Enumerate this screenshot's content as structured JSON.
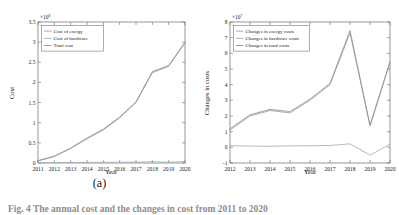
{
  "figure": {
    "caption": "Fig. 4  The annual cost and the changes in cost from 2011 to 2020",
    "subcaptions": [
      "(a)",
      "(b)"
    ],
    "background_color": "#ffffff",
    "axis_color": "#6a6a6a"
  },
  "chart_data": [
    {
      "type": "line",
      "panel": "a",
      "title": "",
      "xlabel": "Year",
      "ylabel": "Cost",
      "y_exponent_label": "×10",
      "y_exponent_power": "8",
      "y_multiplier": 100000000,
      "xlim": [
        2011,
        2020
      ],
      "ylim": [
        0,
        3.5
      ],
      "xticks": [
        "2011",
        "2012",
        "2013",
        "2014",
        "2015",
        "2016",
        "2017",
        "2018",
        "2019",
        "2020"
      ],
      "yticks": [
        "0",
        "0.5",
        "1",
        "1.5",
        "2",
        "2.5",
        "3",
        "3.5"
      ],
      "grid": false,
      "legend_position": "upper left",
      "x": [
        2011,
        2012,
        2013,
        2014,
        2015,
        2016,
        2017,
        2018,
        2019,
        2020
      ],
      "series": [
        {
          "name": "Cost of energy",
          "color": "#9aa0a6",
          "values": [
            0.05,
            0.16,
            0.36,
            0.6,
            0.82,
            1.12,
            1.5,
            2.24,
            2.4,
            2.98
          ]
        },
        {
          "name": "Cost of hardware",
          "color": "#a8aeb4",
          "values": [
            0.01,
            0.012,
            0.014,
            0.016,
            0.018,
            0.02,
            0.022,
            0.03,
            0.022,
            0.035
          ]
        },
        {
          "name": "Total cost",
          "color": "#8c9298",
          "values": [
            0.06,
            0.17,
            0.37,
            0.62,
            0.84,
            1.14,
            1.52,
            2.27,
            2.42,
            3.0
          ]
        }
      ]
    },
    {
      "type": "line",
      "panel": "b",
      "title": "",
      "xlabel": "Year",
      "ylabel": "Changes in costs",
      "y_exponent_label": "×10",
      "y_exponent_power": "7",
      "y_multiplier": 10000000,
      "xlim": [
        2012,
        2020
      ],
      "ylim": [
        -1,
        8
      ],
      "xticks": [
        "2012",
        "2013",
        "2014",
        "2015",
        "2016",
        "2017",
        "2018",
        "2019",
        "2020"
      ],
      "yticks": [
        "-1",
        "0",
        "1",
        "2",
        "3",
        "4",
        "5",
        "6",
        "7",
        "8"
      ],
      "grid": false,
      "legend_position": "upper left",
      "x": [
        2012,
        2013,
        2014,
        2015,
        2016,
        2017,
        2018,
        2019,
        2020
      ],
      "series": [
        {
          "name": "Changes in energy costs",
          "color": "#9aa0a6",
          "values": [
            1.1,
            2.0,
            2.35,
            2.2,
            3.0,
            4.0,
            7.3,
            1.35,
            5.4
          ]
        },
        {
          "name": "Changes in hardware costs",
          "color": "#a8aeb4",
          "values": [
            0.1,
            0.08,
            0.07,
            0.09,
            0.1,
            0.12,
            0.22,
            -0.5,
            0.2
          ]
        },
        {
          "name": "Changes in total costs",
          "color": "#8c9298",
          "values": [
            1.18,
            2.08,
            2.42,
            2.28,
            3.08,
            4.08,
            7.45,
            1.42,
            5.48
          ]
        }
      ]
    }
  ]
}
